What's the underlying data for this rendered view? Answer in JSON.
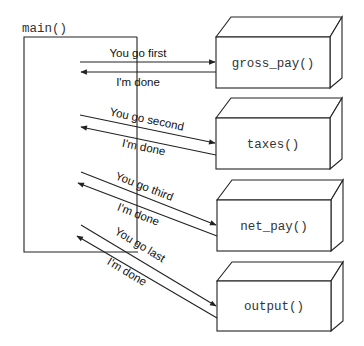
{
  "diagram": {
    "caller": {
      "label": "main()"
    },
    "functions": [
      {
        "label": "gross_pay()",
        "call": "You go first",
        "return": "I'm done"
      },
      {
        "label": "taxes()",
        "call": "You go second",
        "return": "I'm done"
      },
      {
        "label": "net_pay()",
        "call": "You go third",
        "return": "I'm done"
      },
      {
        "label": "output()",
        "call": "You go last",
        "return": "I'm done"
      }
    ],
    "colors": {
      "line": "#222222",
      "text": "#111111",
      "background": "#ffffff"
    }
  }
}
